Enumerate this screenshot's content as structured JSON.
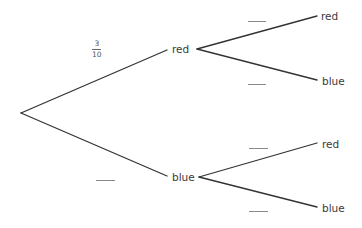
{
  "diagram": {
    "type": "probability-tree",
    "root": {
      "branches": [
        {
          "label": "red",
          "probability": {
            "numerator": "3",
            "denominator": "10"
          },
          "children": [
            {
              "label": "red",
              "probability_blank": true
            },
            {
              "label": "blue",
              "probability_blank": true
            }
          ]
        },
        {
          "label": "blue",
          "probability_blank": true,
          "children": [
            {
              "label": "red",
              "probability_blank": true
            },
            {
              "label": "blue",
              "probability_blank": true
            }
          ]
        }
      ]
    },
    "labels": {
      "first_red": "red",
      "first_blue": "blue",
      "red_red": "red",
      "red_blue": "blue",
      "blue_red": "red",
      "blue_blue": "blue"
    },
    "fraction_first_red": {
      "numerator": "3",
      "denominator": "10"
    },
    "colors": {
      "line": "#333333",
      "text": "#3a3a3a",
      "blank": "#8a8a8a"
    }
  }
}
